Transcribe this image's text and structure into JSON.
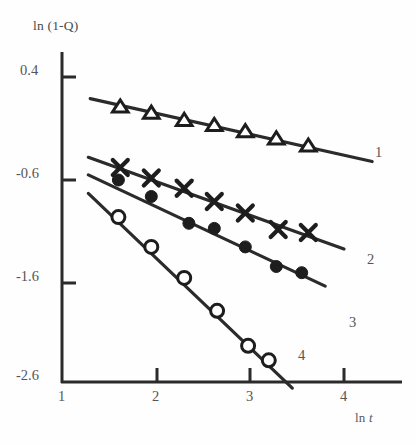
{
  "chart_data": {
    "type": "scatter",
    "title": "",
    "xlabel": "ln t",
    "ylabel": "ln (1-Q)",
    "xlim": [
      1,
      4.5
    ],
    "ylim": [
      -2.6,
      0.65
    ],
    "xticks": [
      "1",
      "2",
      "3",
      "4"
    ],
    "xtick_values": [
      1,
      2,
      3,
      4
    ],
    "yticks": [
      "0.4",
      "-0.6",
      "-1.6",
      "-2.6"
    ],
    "ytick_values": [
      0.4,
      -0.6,
      -1.6,
      -2.6
    ],
    "grid": false,
    "legend_position": "line-end-labels",
    "series": [
      {
        "name": "1",
        "marker": "open-triangle",
        "label_x": 4.35,
        "label_y": -0.25,
        "fit_line": {
          "x0": 1.3,
          "y0": 0.19,
          "x1": 4.3,
          "y1": -0.42
        },
        "x": [
          1.62,
          1.95,
          2.3,
          2.62,
          2.95,
          3.28,
          3.62
        ],
        "y": [
          0.11,
          0.05,
          -0.02,
          -0.07,
          -0.13,
          -0.2,
          -0.27
        ]
      },
      {
        "name": "2",
        "marker": "cross",
        "label_x": 4.1,
        "label_y": -1.08,
        "fit_line": {
          "x0": 1.28,
          "y0": -0.38,
          "x1": 4.0,
          "y1": -1.27
        },
        "x": [
          1.62,
          1.95,
          2.3,
          2.62,
          2.95,
          3.3,
          3.62
        ],
        "y": [
          -0.48,
          -0.58,
          -0.68,
          -0.81,
          -0.92,
          -1.08,
          -1.11
        ]
      },
      {
        "name": "3",
        "marker": "filled-circle",
        "label_x": 3.92,
        "label_y": -1.72,
        "fit_line": {
          "x0": 1.28,
          "y0": -0.55,
          "x1": 3.8,
          "y1": -1.63
        },
        "x": [
          1.6,
          1.95,
          2.35,
          2.62,
          2.95,
          3.28,
          3.55
        ],
        "y": [
          -0.6,
          -0.76,
          -1.02,
          -1.07,
          -1.25,
          -1.44,
          -1.5
        ]
      },
      {
        "name": "4",
        "marker": "open-circle",
        "label_x": 3.4,
        "label_y": -2.35,
        "fit_line": {
          "x0": 1.28,
          "y0": -0.73,
          "x1": 3.45,
          "y1": -2.62
        },
        "x": [
          1.6,
          1.95,
          2.3,
          2.65,
          2.98,
          3.2
        ],
        "y": [
          -0.96,
          -1.25,
          -1.55,
          -1.87,
          -2.21,
          -2.35
        ]
      }
    ]
  },
  "axes": {
    "y_title": "ln (1-Q)",
    "x_title_prefix": "ln ",
    "x_title_var": "t"
  }
}
